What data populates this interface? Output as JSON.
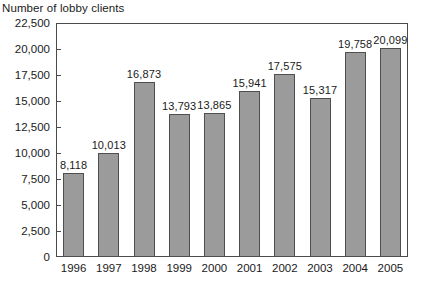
{
  "chart_data": {
    "type": "bar",
    "title": "Number of lobby clients",
    "xlabel": "",
    "ylabel": "",
    "categories": [
      "1996",
      "1997",
      "1998",
      "1999",
      "2000",
      "2001",
      "2002",
      "2003",
      "2004",
      "2005"
    ],
    "values": [
      8118,
      10013,
      16873,
      13793,
      13865,
      15941,
      17575,
      15317,
      19758,
      20099
    ],
    "value_labels": [
      "8,118",
      "10,013",
      "16,873",
      "13,793",
      "13,865",
      "15,941",
      "17,575",
      "15,317",
      "19,758",
      "20,099"
    ],
    "ylim": [
      0,
      22500
    ],
    "ytick_step": 2500,
    "ytick_labels": [
      "22,500",
      "20,000",
      "17,500",
      "15,000",
      "12,500",
      "10,000",
      "7,500",
      "5,000",
      "2,500",
      "0"
    ],
    "ytick_values": [
      22500,
      20000,
      17500,
      15000,
      12500,
      10000,
      7500,
      5000,
      2500,
      0
    ],
    "grid": false,
    "legend": false,
    "bar_color": "#9b9b9b",
    "bar_border_color": "#4f4f4f",
    "axis_color": "#4a4a4a",
    "text_color": "#1a1a1a"
  }
}
